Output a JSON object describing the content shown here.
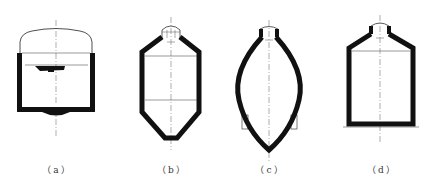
{
  "figure": {
    "panels": [
      {
        "id": "a",
        "label": "（a）",
        "shape": "open-top stirred vessel with domed lid and agitator",
        "caption_x": 57
      },
      {
        "id": "b",
        "label": "（b）",
        "shape": "vessel with conical top and conical bottom",
        "caption_x": 172
      },
      {
        "id": "c",
        "label": "（c）",
        "shape": "lens-shaped (spindle) vessel with supports",
        "caption_x": 270
      },
      {
        "id": "d",
        "label": "（d）",
        "shape": "flat-bottom vessel with conical top",
        "caption_x": 382
      }
    ],
    "colors": {
      "wall": "#111111",
      "line": "#555555",
      "centerline": "#777777",
      "background": "#ffffff"
    }
  }
}
